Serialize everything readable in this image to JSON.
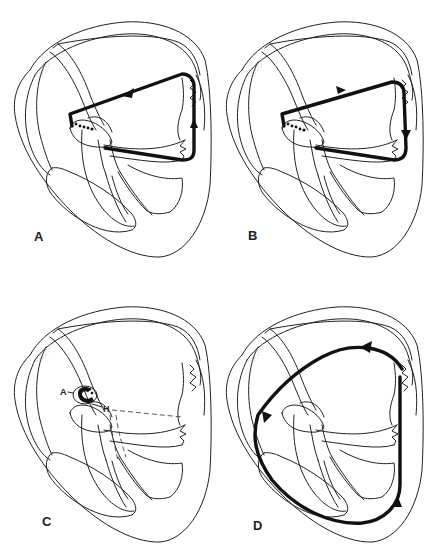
{
  "figure": {
    "panels": [
      {
        "label": "A",
        "circuit": "loop counterclockwise through AV node, atrium and accessory pathway"
      },
      {
        "label": "B",
        "circuit": "loop clockwise through atrium, accessory pathway and AV node"
      },
      {
        "label": "C",
        "circuit": "microreentry within AV node",
        "node_labels": {
          "a": "A",
          "h": "H"
        }
      },
      {
        "label": "D",
        "circuit": "macroreentry around both atria and ventricles"
      }
    ]
  },
  "colors": {
    "line": "#222222",
    "circuit": "#111111",
    "background": "#ffffff",
    "stipple": "#999999"
  }
}
